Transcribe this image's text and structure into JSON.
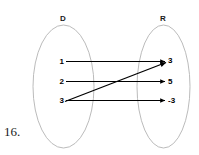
{
  "figure": {
    "number_label": "16.",
    "background_color": "#ffffff",
    "ellipse_stroke_color": "#b3b3b3",
    "arrow_color": "#000000",
    "text_color": "#000000"
  },
  "diagram": {
    "type": "mapping-diagram",
    "domain": {
      "label": "D",
      "elements": [
        "1",
        "2",
        "3"
      ]
    },
    "range": {
      "label": "R",
      "elements": [
        "3",
        "5",
        "-3"
      ]
    },
    "mappings": [
      {
        "from": "1",
        "to": "3",
        "style": "horizontal"
      },
      {
        "from": "2",
        "to": "5",
        "style": "horizontal"
      },
      {
        "from": "3",
        "to": "-3",
        "style": "horizontal"
      },
      {
        "from": "3",
        "to": "3",
        "style": "diagonal-up"
      }
    ]
  }
}
